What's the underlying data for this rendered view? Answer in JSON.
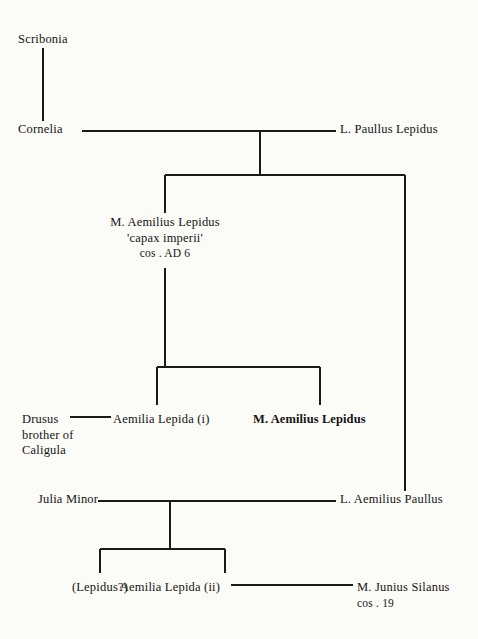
{
  "document": {
    "type": "genealogical-stemma",
    "title": "Aemilii Lepidi family tree",
    "background_color": "#fbfbf7",
    "line_color": "#1a1a1a",
    "text_color": "#151515"
  },
  "nodes": [
    {
      "id": "scribonia",
      "name": "scribonia",
      "lines": [
        "Scribonia"
      ],
      "x": 18,
      "y": 32,
      "align": "left",
      "bold": false
    },
    {
      "id": "cornelia",
      "name": "cornelia",
      "lines": [
        "Cornelia"
      ],
      "x": 18,
      "y": 122,
      "align": "left",
      "bold": false
    },
    {
      "id": "l-paullus-lepidus",
      "name": "l-paullus-lepidus",
      "lines": [
        "L. Paullus Lepidus"
      ],
      "x": 340,
      "y": 122,
      "align": "left",
      "bold": false
    },
    {
      "id": "m-aemilius-lepidus-capax",
      "name": "m-aemilius-lepidus-capax-imperii",
      "lines": [
        "M. Aemilius Lepidus",
        "'capax imperii'",
        "cos . AD 6"
      ],
      "x": 165,
      "y": 215,
      "align": "center",
      "bold": false
    },
    {
      "id": "drusus",
      "name": "drusus-brother-of-caligula",
      "lines": [
        "Drusus",
        "brother of",
        "Caligula"
      ],
      "x": 22,
      "y": 412,
      "align": "left",
      "bold": false
    },
    {
      "id": "aemilia-lepida-i",
      "name": "aemilia-lepida-i",
      "lines": [
        "Aemilia Lepida (i)"
      ],
      "x": 113,
      "y": 412,
      "align": "left",
      "bold": false
    },
    {
      "id": "m-aemilius-lepidus-bold",
      "name": "m-aemilius-lepidus",
      "lines": [
        "M. Aemilius Lepidus"
      ],
      "x": 253,
      "y": 412,
      "align": "left",
      "bold": true
    },
    {
      "id": "julia-minor",
      "name": "julia-minor",
      "lines": [
        "Julia Minor"
      ],
      "x": 38,
      "y": 492,
      "align": "left",
      "bold": false
    },
    {
      "id": "l-aemilius-paullus",
      "name": "l-aemilius-paullus",
      "lines": [
        "L. Aemilius Paullus"
      ],
      "x": 340,
      "y": 492,
      "align": "left",
      "bold": false
    },
    {
      "id": "lepidus-question",
      "name": "lepidus-uncertain",
      "lines": [
        "(Lepidus?)"
      ],
      "x": 100,
      "y": 580,
      "align": "center",
      "bold": false
    },
    {
      "id": "aemilia-lepida-ii",
      "name": "aemilia-lepida-ii",
      "lines": [
        "Aemilia Lepida (ii)"
      ],
      "x": 170,
      "y": 580,
      "align": "center",
      "bold": false
    },
    {
      "id": "m-junius-silanus",
      "name": "m-junius-silanus",
      "lines": [
        "M. Junius Silanus",
        "cos . 19"
      ],
      "x": 357,
      "y": 580,
      "align": "left",
      "bold": false
    }
  ],
  "connectors": [
    {
      "name": "scribonia-to-cornelia",
      "x1": 43,
      "y1": 48,
      "x2": 43,
      "y2": 121
    },
    {
      "name": "cornelia-to-paullus-marriage",
      "x1": 82,
      "y1": 131,
      "x2": 336,
      "y2": 131
    },
    {
      "name": "marriage-descent-drop",
      "x1": 260,
      "y1": 131,
      "x2": 260,
      "y2": 175
    },
    {
      "name": "children-bar-generation-1",
      "x1": 165,
      "y1": 175,
      "x2": 405,
      "y2": 175
    },
    {
      "name": "drop-to-lepidus-capax",
      "x1": 165,
      "y1": 175,
      "x2": 165,
      "y2": 213
    },
    {
      "name": "drop-right-to-aemilius-paullus",
      "x1": 405,
      "y1": 175,
      "x2": 405,
      "y2": 491
    },
    {
      "name": "lepidus-capax-descent",
      "x1": 165,
      "y1": 268,
      "x2": 165,
      "y2": 367
    },
    {
      "name": "children-bar-generation-2",
      "x1": 157,
      "y1": 367,
      "x2": 320,
      "y2": 367
    },
    {
      "name": "drop-to-aemilia-lepida-i",
      "x1": 157,
      "y1": 367,
      "x2": 157,
      "y2": 405
    },
    {
      "name": "drop-to-m-aemilius-lepidus",
      "x1": 320,
      "y1": 367,
      "x2": 320,
      "y2": 405
    },
    {
      "name": "drusus-aemilia-marriage",
      "x1": 70,
      "y1": 417,
      "x2": 111,
      "y2": 417
    },
    {
      "name": "julia-paullus-marriage",
      "x1": 98,
      "y1": 501,
      "x2": 336,
      "y2": 501
    },
    {
      "name": "julia-marriage-drop",
      "x1": 170,
      "y1": 501,
      "x2": 170,
      "y2": 549
    },
    {
      "name": "children-bar-generation-3",
      "x1": 100,
      "y1": 549,
      "x2": 225,
      "y2": 549
    },
    {
      "name": "drop-to-lepidus-uncertain",
      "x1": 100,
      "y1": 549,
      "x2": 100,
      "y2": 573
    },
    {
      "name": "drop-to-aemilia-lepida-ii",
      "x1": 225,
      "y1": 549,
      "x2": 225,
      "y2": 573
    },
    {
      "name": "aemilia-ii-silanus-marriage",
      "x1": 231,
      "y1": 585,
      "x2": 353,
      "y2": 585
    }
  ]
}
